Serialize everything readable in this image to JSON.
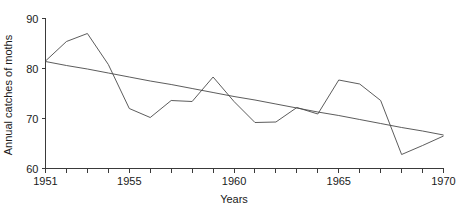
{
  "chart_data": {
    "type": "line",
    "title": "",
    "xlabel": "Years",
    "ylabel": "Annual catches of moths",
    "xlim": [
      1951,
      1970
    ],
    "ylim": [
      60,
      90
    ],
    "grid": false,
    "legend": "none",
    "x_tick_labels": [
      "1951",
      "1955",
      "1960",
      "1965",
      "1970"
    ],
    "x_tick_label_values": [
      1951,
      1955,
      1960,
      1965,
      1970
    ],
    "x_minor_ticks": [
      1952,
      1953,
      1954,
      1956,
      1957,
      1958,
      1959,
      1961,
      1962,
      1963,
      1964,
      1966,
      1967,
      1968,
      1969
    ],
    "y_tick_labels": [
      "60",
      "70",
      "80",
      "90"
    ],
    "y_tick_label_values": [
      60,
      70,
      80,
      90
    ],
    "x": [
      1951,
      1952,
      1953,
      1954,
      1955,
      1956,
      1957,
      1958,
      1959,
      1960,
      1961,
      1962,
      1963,
      1964,
      1965,
      1966,
      1967,
      1968,
      1969,
      1970
    ],
    "series": [
      {
        "name": "Annual catches of moths",
        "values": [
          81.5,
          85.4,
          87.0,
          80.8,
          72.0,
          70.2,
          73.6,
          73.4,
          78.3,
          73.4,
          69.2,
          69.3,
          72.2,
          70.9,
          77.7,
          76.9,
          73.6,
          62.8,
          64.6,
          66.5
        ]
      },
      {
        "name": "Linear trend",
        "values": [
          81.4,
          80.6,
          79.9,
          79.1,
          78.3,
          77.5,
          76.8,
          76.0,
          75.2,
          74.4,
          73.7,
          72.9,
          72.1,
          71.3,
          70.6,
          69.8,
          69.0,
          68.2,
          67.5,
          66.7
        ]
      }
    ]
  }
}
